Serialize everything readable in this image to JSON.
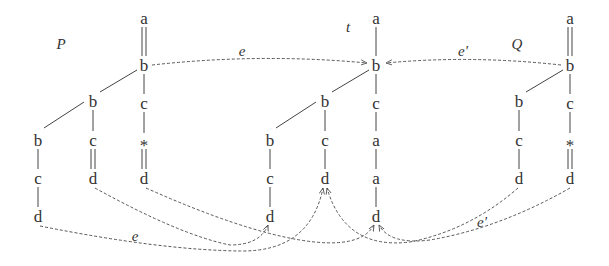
{
  "labels": {
    "P": "P",
    "t": "t",
    "Q": "Q",
    "e_top": "e",
    "e_prime_top": "e'",
    "e_bottom": "e",
    "e_prime_bottom": "e'"
  },
  "trees": {
    "P": {
      "nodes": [
        {
          "id": "p_a",
          "label": "a",
          "x": 144,
          "y": 18
        },
        {
          "id": "p_b",
          "label": "b",
          "x": 144,
          "y": 65
        },
        {
          "id": "p_c",
          "label": "c",
          "x": 144,
          "y": 103
        },
        {
          "id": "p_star",
          "label": "*",
          "x": 144,
          "y": 142
        },
        {
          "id": "p_d",
          "label": "d",
          "x": 144,
          "y": 178
        },
        {
          "id": "p_mb",
          "label": "b",
          "x": 93,
          "y": 101
        },
        {
          "id": "p_mc",
          "label": "c",
          "x": 93,
          "y": 140
        },
        {
          "id": "p_md",
          "label": "d",
          "x": 93,
          "y": 178
        },
        {
          "id": "p_lb",
          "label": "b",
          "x": 38,
          "y": 140
        },
        {
          "id": "p_lc",
          "label": "c",
          "x": 38,
          "y": 178
        },
        {
          "id": "p_ld",
          "label": "d",
          "x": 38,
          "y": 216
        }
      ]
    },
    "t": {
      "nodes": [
        {
          "id": "t_a",
          "label": "a",
          "x": 376,
          "y": 18
        },
        {
          "id": "t_b",
          "label": "b",
          "x": 376,
          "y": 65
        },
        {
          "id": "t_c",
          "label": "c",
          "x": 376,
          "y": 103
        },
        {
          "id": "t_a2",
          "label": "a",
          "x": 376,
          "y": 140
        },
        {
          "id": "t_a3",
          "label": "a",
          "x": 376,
          "y": 178
        },
        {
          "id": "t_d",
          "label": "d",
          "x": 376,
          "y": 216
        },
        {
          "id": "t_mb",
          "label": "b",
          "x": 325,
          "y": 101
        },
        {
          "id": "t_mc",
          "label": "c",
          "x": 325,
          "y": 140
        },
        {
          "id": "t_md",
          "label": "d",
          "x": 325,
          "y": 178
        },
        {
          "id": "t_lb",
          "label": "b",
          "x": 270,
          "y": 140
        },
        {
          "id": "t_lc",
          "label": "c",
          "x": 270,
          "y": 178
        },
        {
          "id": "t_ld",
          "label": "d",
          "x": 270,
          "y": 216
        }
      ]
    },
    "Q": {
      "nodes": [
        {
          "id": "q_a",
          "label": "a",
          "x": 570,
          "y": 18
        },
        {
          "id": "q_b",
          "label": "b",
          "x": 570,
          "y": 65
        },
        {
          "id": "q_c",
          "label": "c",
          "x": 570,
          "y": 103
        },
        {
          "id": "q_star",
          "label": "*",
          "x": 570,
          "y": 142
        },
        {
          "id": "q_d",
          "label": "d",
          "x": 570,
          "y": 178
        },
        {
          "id": "q_mb",
          "label": "b",
          "x": 519,
          "y": 101
        },
        {
          "id": "q_mc",
          "label": "c",
          "x": 519,
          "y": 140
        },
        {
          "id": "q_md",
          "label": "d",
          "x": 519,
          "y": 178
        }
      ]
    }
  },
  "colors": {
    "ink": "#333333",
    "dashed": "#555555",
    "background": "#ffffff"
  }
}
